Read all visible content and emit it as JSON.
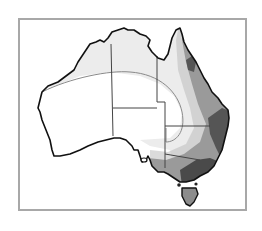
{
  "map": {
    "subject": "Australia",
    "style": "grayscale shaded zone map",
    "zones": [
      {
        "name": "unshaded",
        "color": "#ffffff"
      },
      {
        "name": "light",
        "color": "#ececec"
      },
      {
        "name": "medium-light",
        "color": "#d9d9d9"
      },
      {
        "name": "medium",
        "color": "#9a9a9a"
      },
      {
        "name": "dark",
        "color": "#555555"
      }
    ],
    "colors": {
      "frame": "#a8a8a8",
      "coastline": "#111111",
      "state_border": "#444444",
      "zone_boundary_line": "#8a8a8a"
    }
  }
}
